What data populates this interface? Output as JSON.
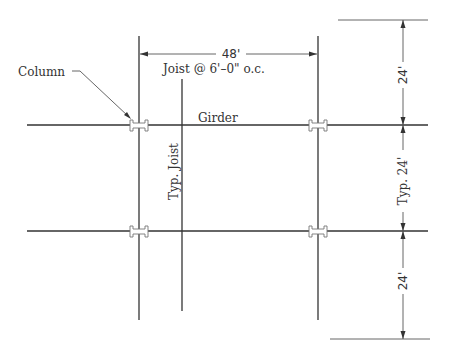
{
  "diagram": {
    "type": "structural-framing-plan",
    "labels": {
      "column": "Column",
      "joist_spacing": "Joist @ 6'–0\" o.c.",
      "girder": "Girder",
      "typ_joist": "Typ. Joist"
    },
    "dimensions": {
      "span": "48'",
      "bay_top": "24'",
      "bay_typ": "Typ. 24'",
      "bay_bottom": "24'"
    },
    "colors": {
      "line": "#333333",
      "column_outline": "#777777",
      "background": "#ffffff"
    }
  }
}
